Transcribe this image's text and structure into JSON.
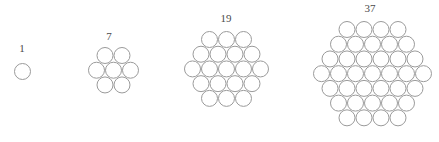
{
  "diagram": {
    "background_color": "#ffffff",
    "circle_stroke_color": "#9a9a9a",
    "circle_fill": "none",
    "label_color": "#4a4a4a",
    "figures": [
      {
        "label": "1",
        "count": 1,
        "rows": [
          1
        ],
        "circle_diameter": 17,
        "center_x": 22,
        "label_x": 22,
        "label_y": 42,
        "grid_top": 62
      },
      {
        "label": "7",
        "count": 7,
        "rows": [
          2,
          3,
          2
        ],
        "circle_diameter": 17,
        "center_x": 113,
        "label_x": 109,
        "label_y": 30,
        "grid_top": 46
      },
      {
        "label": "19",
        "count": 19,
        "rows": [
          3,
          4,
          5,
          4,
          3
        ],
        "circle_diameter": 17,
        "center_x": 226,
        "label_x": 226,
        "label_y": 12,
        "grid_top": 30
      },
      {
        "label": "37",
        "count": 37,
        "rows": [
          4,
          5,
          6,
          7,
          6,
          5,
          4
        ],
        "circle_diameter": 17,
        "center_x": 372,
        "label_x": 370,
        "label_y": 2,
        "grid_top": 20
      }
    ]
  },
  "chart_data": {
    "type": "diagram",
    "categories": [
      "1",
      "7",
      "19",
      "37"
    ],
    "values": [
      1,
      7,
      19,
      37
    ],
    "series": [
      {
        "name": "centered hexagonal number",
        "values": [
          1,
          7,
          19,
          37
        ]
      }
    ],
    "row_counts": [
      [
        1
      ],
      [
        2,
        3,
        2
      ],
      [
        3,
        4,
        5,
        4,
        3
      ],
      [
        4,
        5,
        6,
        7,
        6,
        5,
        4
      ]
    ],
    "xlabel": "",
    "ylabel": "",
    "legend": []
  }
}
